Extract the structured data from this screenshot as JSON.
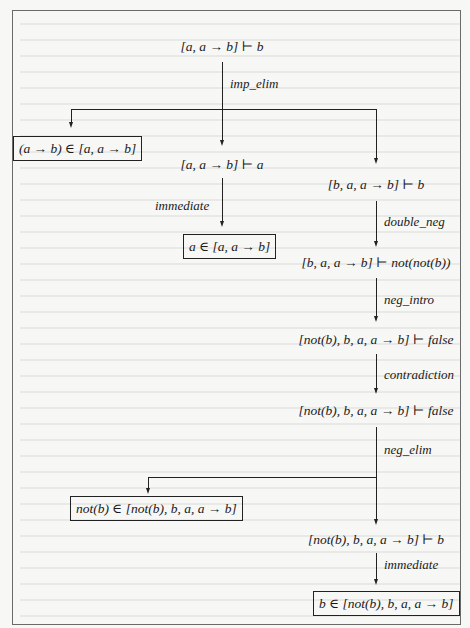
{
  "diagram": {
    "type": "proof-tree",
    "root": {
      "sequent": "[a, a → b] ⊢ b",
      "rule": "imp_elim"
    },
    "branches": {
      "left_leaf": {
        "text": "(a → b) ∈ [a, a → b]",
        "boxed": true
      },
      "middle": {
        "sequent": "[a, a → b] ⊢ a",
        "rule": "immediate",
        "leaf": {
          "text": "a ∈ [a, a → b]",
          "boxed": true
        }
      },
      "right": {
        "steps": [
          {
            "sequent": "[b, a, a → b] ⊢ b",
            "rule": "double_neg"
          },
          {
            "sequent": "[b, a, a → b] ⊢ not(not(b))",
            "rule": "neg_intro"
          },
          {
            "sequent": "[not(b), b, a, a → b] ⊢ false",
            "rule": "contradiction"
          },
          {
            "sequent": "[not(b), b, a, a → b] ⊢ false",
            "rule": "neg_elim"
          }
        ],
        "neg_elim_left_leaf": {
          "text": "not(b) ∈ [not(b), b, a, a → b]",
          "boxed": true
        },
        "neg_elim_right": {
          "sequent": "[not(b), b, a, a → b] ⊢ b",
          "rule": "immediate",
          "leaf": {
            "text": "b ∈ [not(b), b, a, a → b]",
            "boxed": true
          }
        }
      }
    },
    "colors": {
      "line": "#222222",
      "frame": "#6a6a6a",
      "background": "#f7f7f5"
    }
  }
}
